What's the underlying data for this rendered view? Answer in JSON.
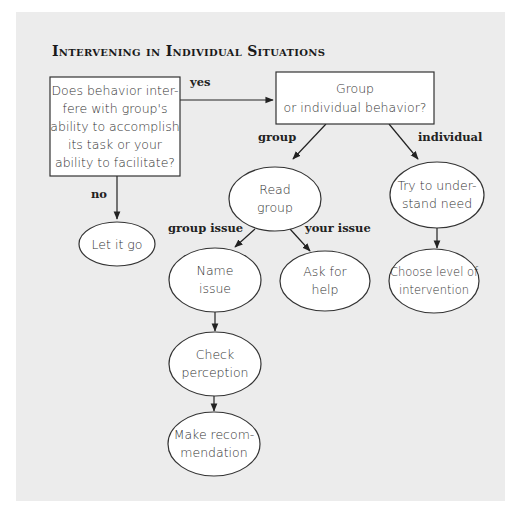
{
  "title": "Intervening in Individual Situations",
  "nodes": {
    "question": {
      "lines": [
        "Does behavior inter-",
        "fere with group's",
        "ability to accomplish",
        "its task or your",
        "ability to facilitate?"
      ],
      "shape": "rect"
    },
    "group_or_individual": {
      "lines": [
        "Group",
        "or individual behavior?"
      ],
      "shape": "rect"
    },
    "let_it_go": {
      "lines": [
        "Let it go"
      ],
      "shape": "ellipse"
    },
    "read_group": {
      "lines": [
        "Read",
        "group"
      ],
      "shape": "ellipse"
    },
    "try_to_understand": {
      "lines": [
        "Try to under-",
        "stand need"
      ],
      "shape": "ellipse"
    },
    "name_issue": {
      "lines": [
        "Name",
        "issue"
      ],
      "shape": "ellipse"
    },
    "ask_for_help": {
      "lines": [
        "Ask for",
        "help"
      ],
      "shape": "ellipse"
    },
    "choose_level": {
      "lines": [
        "Choose level of",
        "intervention"
      ],
      "shape": "ellipse"
    },
    "check_perception": {
      "lines": [
        "Check",
        "perception"
      ],
      "shape": "ellipse"
    },
    "make_recommendation": {
      "lines": [
        "Make recom-",
        "mendation"
      ],
      "shape": "ellipse"
    }
  },
  "edge_labels": {
    "yes": "yes",
    "no": "no",
    "group": "group",
    "individual": "individual",
    "group_issue": "group issue",
    "your_issue": "your issue"
  },
  "edges": [
    {
      "from": "question",
      "to": "group_or_individual",
      "label": "yes"
    },
    {
      "from": "question",
      "to": "let_it_go",
      "label": "no"
    },
    {
      "from": "group_or_individual",
      "to": "read_group",
      "label": "group"
    },
    {
      "from": "group_or_individual",
      "to": "try_to_understand",
      "label": "individual"
    },
    {
      "from": "read_group",
      "to": "name_issue",
      "label": "group issue"
    },
    {
      "from": "read_group",
      "to": "ask_for_help",
      "label": "your issue"
    },
    {
      "from": "try_to_understand",
      "to": "choose_level",
      "label": ""
    },
    {
      "from": "name_issue",
      "to": "check_perception",
      "label": ""
    },
    {
      "from": "check_perception",
      "to": "make_recommendation",
      "label": ""
    }
  ],
  "colors": {
    "panel_background": "#ececec",
    "page_background": "#ffffff",
    "node_fill": "#ffffff",
    "stroke": "#333333"
  }
}
